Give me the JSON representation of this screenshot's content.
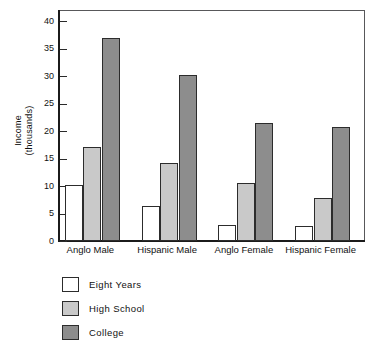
{
  "chart_data": {
    "type": "bar",
    "title": "",
    "xlabel": "",
    "ylabel": "Income\n(thousands)",
    "ylim": [
      0,
      42
    ],
    "yticks": [
      0,
      5,
      10,
      15,
      20,
      25,
      30,
      35,
      40
    ],
    "ytick_labels": [
      "0",
      "5",
      "10",
      "15",
      "20",
      "25",
      "30",
      "35",
      "40"
    ],
    "grid": false,
    "legend_position": "below-left",
    "categories": [
      "Anglo Male",
      "Hispanic Male",
      "Anglo Female",
      "Hispanic Female"
    ],
    "series": [
      {
        "name": "Eight Years",
        "color": "#ffffff",
        "values": [
          10.2,
          6.3,
          2.9,
          2.8
        ]
      },
      {
        "name": "High School",
        "color": "#c9c9c9",
        "values": [
          17.1,
          14.2,
          10.5,
          7.8
        ]
      },
      {
        "name": "College",
        "color": "#8d8d8d",
        "values": [
          37.0,
          30.2,
          21.4,
          20.7
        ]
      }
    ]
  },
  "legend": {
    "items": [
      {
        "label": "Eight Years"
      },
      {
        "label": "High School"
      },
      {
        "label": "College"
      }
    ]
  },
  "colors": {
    "axis": "#1b1b1b",
    "frame": "#58585a",
    "bar_outline": "#2c2c2c",
    "eight_years": "#ffffff",
    "high_school": "#c9c9c9",
    "college": "#8d8d8d"
  }
}
